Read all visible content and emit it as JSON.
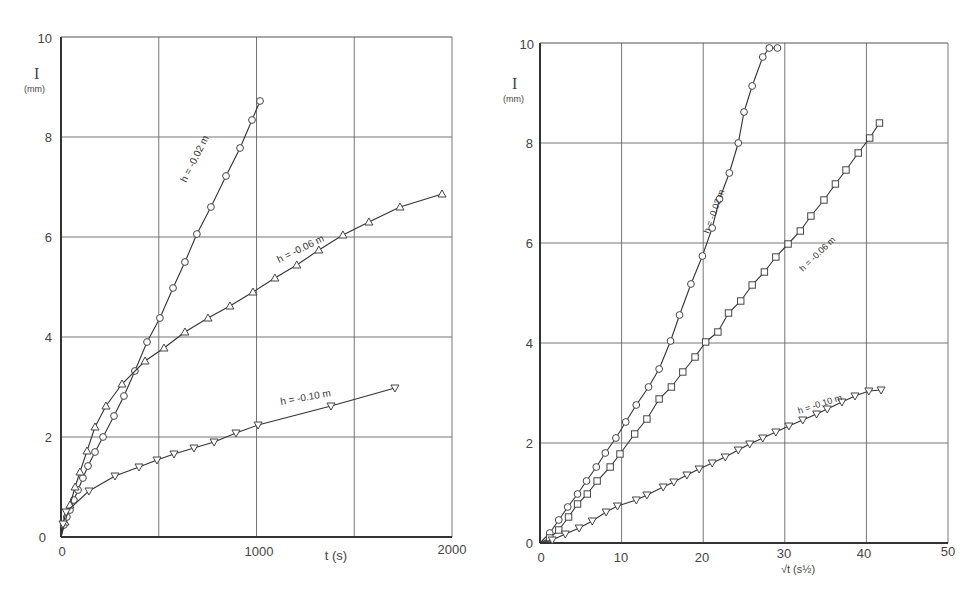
{
  "chart_data": [
    {
      "type": "line",
      "title": "",
      "xlabel": "t (s)",
      "ylabel": "I",
      "ylabel_unit": "(mm)",
      "xlim": [
        0,
        2000
      ],
      "ylim": [
        0,
        10
      ],
      "xticks": [
        "0",
        "1000",
        "2000"
      ],
      "yticks": [
        "0",
        "2",
        "4",
        "6",
        "8",
        "10"
      ],
      "grid": true,
      "series": [
        {
          "name": "h = -0.02 m",
          "marker": "circle",
          "x": [
            15,
            30,
            46,
            66,
            87,
            112,
            138,
            174,
            215,
            271,
            322,
            378,
            440,
            506,
            573,
            634,
            695,
            767,
            844,
            916,
            977,
            1018
          ],
          "y": [
            0.24,
            0.4,
            0.54,
            0.74,
            0.94,
            1.18,
            1.42,
            1.7,
            2.0,
            2.42,
            2.82,
            3.32,
            3.9,
            4.38,
            4.98,
            5.5,
            6.06,
            6.6,
            7.22,
            7.78,
            8.34,
            8.72
          ]
        },
        {
          "name": "h = -0.06 m",
          "marker": "triangle-up",
          "x": [
            20,
            46,
            72,
            97,
            133,
            174,
            230,
            312,
            430,
            527,
            634,
            752,
            864,
            982,
            1094,
            1206,
            1319,
            1442,
            1575,
            1734,
            1949
          ],
          "y": [
            0.3,
            0.64,
            1.0,
            1.3,
            1.72,
            2.2,
            2.62,
            3.06,
            3.52,
            3.78,
            4.1,
            4.38,
            4.62,
            4.9,
            5.18,
            5.44,
            5.74,
            6.04,
            6.3,
            6.6,
            6.86
          ]
        },
        {
          "name": "h = -0.10 m",
          "marker": "triangle-down",
          "x": [
            10,
            26,
            143,
            276,
            399,
            491,
            578,
            680,
            783,
            895,
            1008,
            1381,
            1708
          ],
          "y": [
            0.26,
            0.5,
            0.92,
            1.22,
            1.4,
            1.54,
            1.66,
            1.78,
            1.9,
            2.08,
            2.24,
            2.62,
            2.98
          ]
        }
      ]
    },
    {
      "type": "line",
      "title": "",
      "xlabel": "√t (s^½)",
      "ylabel": "I",
      "ylabel_unit": "(mm)",
      "xlim": [
        0,
        50
      ],
      "ylim": [
        0,
        10
      ],
      "xticks": [
        "0",
        "10",
        "20",
        "30",
        "40",
        "50"
      ],
      "yticks": [
        "0",
        "2",
        "4",
        "6",
        "8",
        "10"
      ],
      "grid": true,
      "series": [
        {
          "name": "h = -0.02 m",
          "marker": "circle",
          "x": [
            1.2,
            2.3,
            3.4,
            4.6,
            5.7,
            6.9,
            8.0,
            9.3,
            10.5,
            11.8,
            13.3,
            14.6,
            16.0,
            17.1,
            18.5,
            19.9,
            21.1,
            22.0,
            23.2,
            24.3,
            25.0,
            26.0,
            27.3,
            28.1,
            29.1
          ],
          "y": [
            0.2,
            0.46,
            0.72,
            0.98,
            1.24,
            1.52,
            1.8,
            2.1,
            2.42,
            2.76,
            3.12,
            3.48,
            4.04,
            4.56,
            5.18,
            5.74,
            6.3,
            6.88,
            7.4,
            8.0,
            8.62,
            9.14,
            9.72,
            9.9,
            9.9
          ]
        },
        {
          "name": "h = -0.06 m",
          "marker": "square",
          "x": [
            1.2,
            2.3,
            3.5,
            4.6,
            5.8,
            7.0,
            8.6,
            9.8,
            11.6,
            13.1,
            14.6,
            16.1,
            17.5,
            19.0,
            20.3,
            21.8,
            23.1,
            24.6,
            26.0,
            27.5,
            28.9,
            30.4,
            31.9,
            33.2,
            34.8,
            36.2,
            37.5,
            39.0,
            40.4,
            41.6
          ],
          "y": [
            0.1,
            0.26,
            0.52,
            0.78,
            0.98,
            1.24,
            1.52,
            1.78,
            2.18,
            2.48,
            2.88,
            3.12,
            3.42,
            3.72,
            4.02,
            4.22,
            4.6,
            4.84,
            5.16,
            5.42,
            5.72,
            5.98,
            6.24,
            6.54,
            6.86,
            7.18,
            7.46,
            7.8,
            8.1,
            8.4
          ]
        },
        {
          "name": "h = -0.10 m",
          "marker": "triangle-down",
          "x": [
            1.5,
            3.1,
            4.8,
            6.4,
            8.1,
            9.5,
            11.8,
            13.1,
            15.1,
            16.4,
            18.0,
            19.5,
            21.1,
            22.7,
            24.3,
            25.7,
            27.3,
            28.9,
            30.5,
            32.2,
            33.9,
            35.2,
            37.0,
            38.6,
            40.3,
            41.8
          ],
          "y": [
            0.06,
            0.18,
            0.3,
            0.44,
            0.62,
            0.74,
            0.86,
            0.96,
            1.12,
            1.22,
            1.36,
            1.48,
            1.6,
            1.72,
            1.86,
            1.98,
            2.1,
            2.22,
            2.34,
            2.46,
            2.58,
            2.68,
            2.82,
            2.94,
            3.04,
            3.06
          ]
        }
      ]
    }
  ],
  "left": {
    "ylabel": "I",
    "yunit": "(mm)",
    "xlabel": "t (s)",
    "yticks": [
      "0",
      "2",
      "4",
      "6",
      "8",
      "10"
    ],
    "xticks": [
      "0",
      "1000",
      "2000"
    ],
    "labels": [
      "h = -0.02 m",
      "h = -0.06 m",
      "h = -0.10 m"
    ]
  },
  "right": {
    "ylabel": "I",
    "yunit": "(mm)",
    "xlabel": "√t (s½)",
    "yticks": [
      "0",
      "2",
      "4",
      "6",
      "8",
      "10"
    ],
    "xticks": [
      "0",
      "10",
      "20",
      "30",
      "40",
      "50"
    ],
    "labels": [
      "h = -0.02 m",
      "h = -0.06 m",
      "h = -0.10 m"
    ]
  }
}
